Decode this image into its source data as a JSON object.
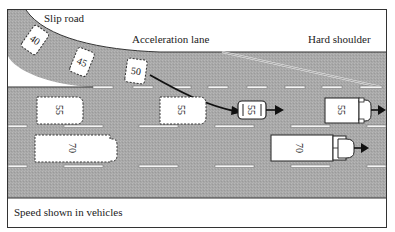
{
  "labels": {
    "slip_road": "Slip road",
    "acceleration_lane": "Acceleration lane",
    "hard_shoulder": "Hard shoulder",
    "caption": "Speed shown in vehicles"
  },
  "vehicles": [
    {
      "id": "slip-car-1",
      "speed": "40",
      "type": "car",
      "style": "dashed"
    },
    {
      "id": "slip-car-2",
      "speed": "45",
      "type": "car",
      "style": "dashed"
    },
    {
      "id": "slip-car-3",
      "speed": "50",
      "type": "car",
      "style": "dashed"
    },
    {
      "id": "lane1-car-left",
      "speed": "55",
      "type": "car",
      "style": "dashed"
    },
    {
      "id": "lane1-car-mid",
      "speed": "55",
      "type": "car",
      "style": "dashed"
    },
    {
      "id": "merging-car",
      "speed": "55",
      "type": "car",
      "style": "solid"
    },
    {
      "id": "lane1-van-right",
      "speed": "55",
      "type": "van",
      "style": "solid"
    },
    {
      "id": "lane2-coach-left",
      "speed": "70",
      "type": "coach",
      "style": "dashed"
    },
    {
      "id": "lane2-truck-right",
      "speed": "70",
      "type": "truck",
      "style": "solid"
    }
  ],
  "colors": {
    "road": "#a9a9a9",
    "vehicle_fill": "#ffffff",
    "line": "#222222"
  }
}
